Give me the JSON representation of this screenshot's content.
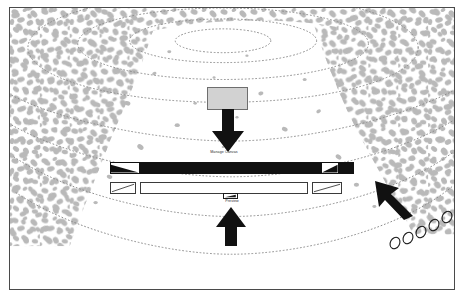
{
  "figure": {
    "title": "",
    "type": "geological-cross-section-schematic",
    "background_color": "#ffffff",
    "frame_border_color": "#4a4a4a",
    "texture_color": "#b9b9b9",
    "contour_color": "#8c8c8c",
    "ink_color": "#111111"
  },
  "labels": {
    "upper": "Manage Canvas",
    "lower": "Preview"
  },
  "elements": {
    "specimen_box": {
      "name": "specimen-box",
      "fill": "#d2d2d2",
      "stroke": "#6e6e6e"
    },
    "main_bar": {
      "name": "main-bar",
      "fill": "#111111",
      "segments": 2,
      "caps": 2
    },
    "lower_bar": {
      "name": "lower-bar",
      "fill": "#ffffff",
      "stroke": "#3a3a3a",
      "caps": 2
    },
    "chip": {
      "name": "hatched-chip",
      "fill": "#ffffff",
      "stroke": "#1a1a1a"
    }
  },
  "annotations": {
    "down_arrow": {
      "name": "down-arrow",
      "direction": "down",
      "color": "#111111"
    },
    "up_arrow": {
      "name": "up-arrow",
      "direction": "up",
      "color": "#111111"
    },
    "pointer_arrow": {
      "name": "pointer-arrow",
      "direction": "up-left",
      "color": "#111111"
    },
    "trail_ellipses": {
      "name": "trail-ellipses",
      "count": 5,
      "stroke": "#1a1a1a",
      "fill": "none"
    }
  },
  "contours": {
    "name": "contour-lines",
    "style": "dotted",
    "color": "#8c8c8c",
    "rings": 7
  },
  "texture": {
    "name": "stipple-texture",
    "color": "#b9b9b9",
    "description": "irregular rock blob pattern concentrated at left, right and top edges"
  }
}
